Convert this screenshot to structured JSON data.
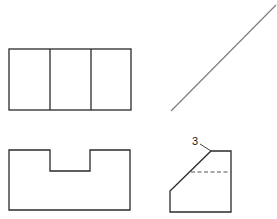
{
  "figure": {
    "type": "orthographic-projection",
    "views": [
      {
        "name": "top-view",
        "shape": "rectangle divided into three vertical panels"
      },
      {
        "name": "front-view",
        "shape": "rectangle with centered rectangular notch on top"
      },
      {
        "name": "side-view",
        "shape": "pentagon with chamfered upper-left corner and hidden line"
      },
      {
        "name": "miter-line",
        "shape": "45-degree projection line"
      }
    ],
    "annotations": [
      {
        "label": "3",
        "target": "chamfer top corner of side view"
      }
    ],
    "colors": {
      "line": "#2a2a2a",
      "miter_line": "#7a7a7a",
      "hidden_line": "#555555",
      "background": "#ffffff"
    }
  }
}
